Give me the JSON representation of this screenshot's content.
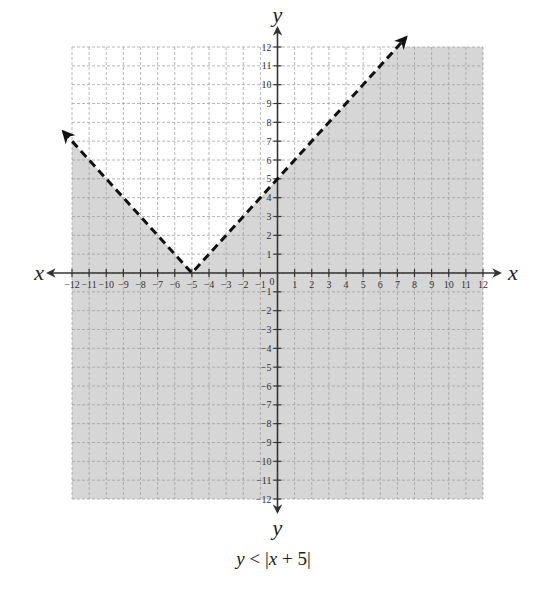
{
  "chart_data": {
    "type": "line",
    "title": "",
    "caption": "y < |x + 5|",
    "caption_parts": {
      "var_y": "y",
      "op": " < |",
      "var_x": "x",
      "rest": " + 5|"
    },
    "xlabel": "x",
    "ylabel": "y",
    "xlim": [
      -12,
      12
    ],
    "ylim": [
      -12,
      12
    ],
    "grid": true,
    "x_ticks": [
      -12,
      -11,
      -10,
      -9,
      -8,
      -7,
      -6,
      -5,
      -4,
      -3,
      -2,
      -1,
      1,
      2,
      3,
      4,
      5,
      6,
      7,
      8,
      9,
      10,
      11,
      12
    ],
    "y_ticks": [
      -12,
      -11,
      -10,
      -9,
      -8,
      -7,
      -6,
      -5,
      -4,
      -3,
      -2,
      -1,
      1,
      2,
      3,
      4,
      5,
      6,
      7,
      8,
      9,
      10,
      11,
      12
    ],
    "origin_label": "0",
    "series": [
      {
        "name": "y = |x + 5|",
        "style": "dashed",
        "boundary": "excluded",
        "vertex": [
          -5,
          0
        ],
        "points": [
          [
            -12.5,
            7.5
          ],
          [
            -5,
            0
          ],
          [
            7.5,
            12.5
          ]
        ]
      }
    ],
    "shaded_region": {
      "inequality": "y < |x + 5|",
      "description": "region below the V-shaped boundary, within the grid",
      "color": "#d6d6d6"
    },
    "colors": {
      "shade": "#d6d6d6",
      "grid": "#9a9a9a",
      "axis": "#333333",
      "boundary": "#111111"
    }
  }
}
